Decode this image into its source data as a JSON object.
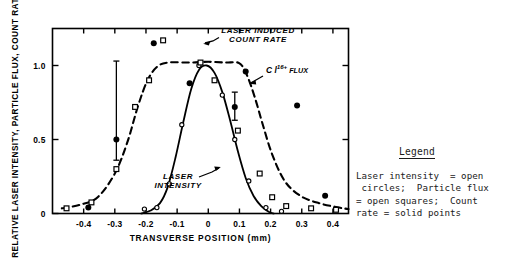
{
  "figure": {
    "background": "#ffffff",
    "ink": "#000000"
  },
  "legend": {
    "title": "Legend",
    "lines": [
      "Laser intensity  = open",
      " circles;  Particle flux",
      "= open squares;  Count",
      "rate = solid points"
    ]
  },
  "annotations": {
    "count_rate": {
      "line1": "LASER INDUCED",
      "line2": "COUNT RATE"
    },
    "flux": {
      "base": "C l",
      "sup": "16+",
      "tail": "FLUX"
    },
    "laser_intensity": {
      "line1": "LASER",
      "line2": "INTENSITY"
    }
  },
  "chart_data": {
    "type": "line",
    "title": "",
    "xlabel": "TRANSVERSE POSITION (mm)",
    "ylabel": "RELATIVE LASER INTENSITY, PARTICLE FLUX, COUNT RATE",
    "xlim": [
      -0.5,
      0.45
    ],
    "ylim": [
      0,
      1.25
    ],
    "xticks": [
      -0.4,
      -0.3,
      -0.2,
      -0.1,
      0,
      0.1,
      0.2,
      0.3,
      0.4
    ],
    "xticklabels": [
      "-0.4",
      "-0.3",
      "-0.2",
      "-0.1",
      "0",
      "0.1",
      "0.2",
      "0.3",
      "0.4"
    ],
    "yticks": [
      0,
      0.5,
      1.0
    ],
    "yticklabels": [
      "0",
      "0.5",
      "1.0"
    ],
    "grid": false,
    "legend_position": "outside-right",
    "series": [
      {
        "name": "Laser intensity",
        "marker": "open-circle",
        "linestyle": "solid",
        "points": [
          {
            "x": -0.205,
            "y": 0.03
          },
          {
            "x": -0.165,
            "y": 0.04
          },
          {
            "x": -0.125,
            "y": 0.2
          },
          {
            "x": -0.085,
            "y": 0.6
          },
          {
            "x": -0.03,
            "y": 1.0
          },
          {
            "x": 0.045,
            "y": 0.8
          },
          {
            "x": 0.085,
            "y": 0.5
          },
          {
            "x": 0.13,
            "y": 0.22
          },
          {
            "x": 0.185,
            "y": 0.04
          },
          {
            "x": 0.235,
            "y": 0.015
          }
        ],
        "curve": [
          {
            "x": -0.215,
            "y": 0.0
          },
          {
            "x": -0.185,
            "y": 0.02
          },
          {
            "x": -0.155,
            "y": 0.07
          },
          {
            "x": -0.13,
            "y": 0.18
          },
          {
            "x": -0.105,
            "y": 0.38
          },
          {
            "x": -0.08,
            "y": 0.62
          },
          {
            "x": -0.055,
            "y": 0.84
          },
          {
            "x": -0.03,
            "y": 0.97
          },
          {
            "x": -0.005,
            "y": 1.0
          },
          {
            "x": 0.02,
            "y": 0.95
          },
          {
            "x": 0.045,
            "y": 0.82
          },
          {
            "x": 0.07,
            "y": 0.63
          },
          {
            "x": 0.095,
            "y": 0.42
          },
          {
            "x": 0.12,
            "y": 0.24
          },
          {
            "x": 0.145,
            "y": 0.12
          },
          {
            "x": 0.17,
            "y": 0.05
          },
          {
            "x": 0.195,
            "y": 0.01
          },
          {
            "x": 0.21,
            "y": 0.0
          }
        ]
      },
      {
        "name": "Particle flux",
        "marker": "open-square",
        "linestyle": "dashed",
        "points": [
          {
            "x": -0.455,
            "y": 0.035
          },
          {
            "x": -0.375,
            "y": 0.075
          },
          {
            "x": -0.295,
            "y": 0.3
          },
          {
            "x": -0.235,
            "y": 0.72
          },
          {
            "x": -0.19,
            "y": 0.9
          },
          {
            "x": -0.145,
            "y": 1.17
          },
          {
            "x": -0.025,
            "y": 1.02
          },
          {
            "x": 0.02,
            "y": 0.9
          },
          {
            "x": 0.095,
            "y": 0.56
          },
          {
            "x": 0.165,
            "y": 0.27
          },
          {
            "x": 0.205,
            "y": 0.11
          },
          {
            "x": 0.25,
            "y": 0.05
          },
          {
            "x": 0.33,
            "y": 0.035
          },
          {
            "x": 0.41,
            "y": 0.025
          }
        ],
        "curve": [
          {
            "x": -0.47,
            "y": 0.035
          },
          {
            "x": -0.41,
            "y": 0.06
          },
          {
            "x": -0.355,
            "y": 0.11
          },
          {
            "x": -0.3,
            "y": 0.27
          },
          {
            "x": -0.26,
            "y": 0.48
          },
          {
            "x": -0.225,
            "y": 0.73
          },
          {
            "x": -0.195,
            "y": 0.9
          },
          {
            "x": -0.165,
            "y": 0.99
          },
          {
            "x": -0.13,
            "y": 1.02
          },
          {
            "x": -0.06,
            "y": 1.02
          },
          {
            "x": 0.0,
            "y": 1.025
          },
          {
            "x": 0.055,
            "y": 1.02
          },
          {
            "x": 0.1,
            "y": 1.015
          },
          {
            "x": 0.125,
            "y": 0.93
          },
          {
            "x": 0.15,
            "y": 0.78
          },
          {
            "x": 0.175,
            "y": 0.6
          },
          {
            "x": 0.205,
            "y": 0.4
          },
          {
            "x": 0.245,
            "y": 0.22
          },
          {
            "x": 0.295,
            "y": 0.12
          },
          {
            "x": 0.355,
            "y": 0.07
          },
          {
            "x": 0.42,
            "y": 0.04
          },
          {
            "x": 0.45,
            "y": 0.03
          }
        ]
      },
      {
        "name": "Count rate",
        "marker": "solid-point",
        "linestyle": "none",
        "points": [
          {
            "x": -0.385,
            "y": 0.04
          },
          {
            "x": -0.295,
            "y": 0.5,
            "yerr_low": 0.14,
            "yerr_high": 0.53
          },
          {
            "x": -0.175,
            "y": 1.15
          },
          {
            "x": -0.06,
            "y": 0.88
          },
          {
            "x": 0.085,
            "y": 0.72,
            "yerr_low": 0.09,
            "yerr_high": 0.1
          },
          {
            "x": 0.12,
            "y": 0.96
          },
          {
            "x": 0.285,
            "y": 0.73
          },
          {
            "x": 0.375,
            "y": 0.12
          }
        ]
      }
    ]
  }
}
